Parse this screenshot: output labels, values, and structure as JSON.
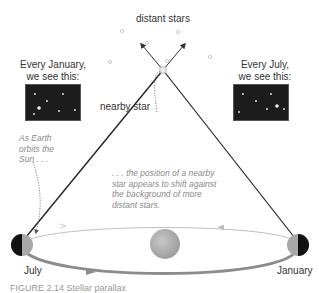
{
  "labels": {
    "distant_stars": "distant stars",
    "nearby_star": "nearby star",
    "january_view_line1": "Every January,",
    "january_view_line2": "we see this:",
    "july_view_line1": "Every July,",
    "july_view_line2": "we see this:",
    "earth_orbit_line1": "As Earth",
    "earth_orbit_line2": "orbits the",
    "earth_orbit_line3": "Sun . . .",
    "shift_line1": ". . . the position of a nearby",
    "shift_line2": "star appears to shift against",
    "shift_line3": "the background of more",
    "shift_line4": "distant stars.",
    "july": "July",
    "january": "January"
  },
  "caption": "FIGURE 2.14 Stellar parallax",
  "colors": {
    "sky_box": "#1c1c1c",
    "orbit_line": "#b5b5b5",
    "orbit_front": "#8c8c8c",
    "sun": "#b0b0b0",
    "sight_line": "#222222",
    "italic_text": "#8a8a8a"
  },
  "icons": {
    "sun": "sun-icon",
    "earth": "earth-icon",
    "nearby_star": "nearby-star-icon",
    "distant_star": "distant-star-icon"
  }
}
